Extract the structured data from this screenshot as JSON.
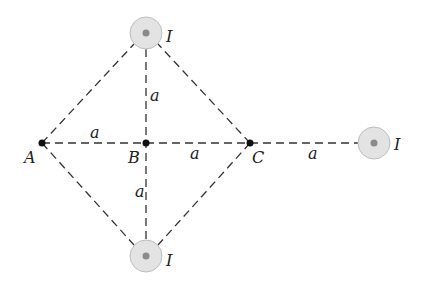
{
  "diagram": {
    "points": [
      {
        "label": "A",
        "x": 42,
        "y": 143
      },
      {
        "label": "B",
        "x": 146,
        "y": 143
      },
      {
        "label": "C",
        "x": 250,
        "y": 143
      }
    ],
    "wires": [
      {
        "label": "I",
        "x": 146,
        "y": 33
      },
      {
        "label": "I",
        "x": 146,
        "y": 256
      },
      {
        "label": "I",
        "x": 374,
        "y": 143
      }
    ],
    "distance_labels": [
      "a",
      "a",
      "a",
      "a",
      "a"
    ],
    "colors": {
      "wire_fill": "#e3e3e3",
      "wire_stroke": "#bdbdbd",
      "wire_dot": "#8a8a8a",
      "line": "#333333"
    }
  }
}
